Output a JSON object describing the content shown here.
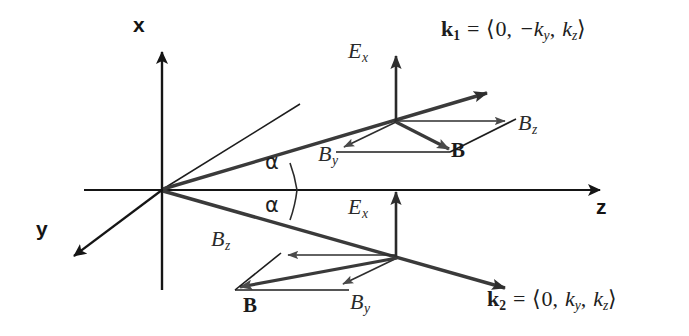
{
  "figure": {
    "background_color": "#ffffff",
    "ink_color": "#1d1d1d",
    "arrow_fill_color": "#4a4a4a",
    "width": 689,
    "height": 336
  },
  "axes": [
    {
      "name": "x",
      "label": "x",
      "direction": "up"
    },
    {
      "name": "y",
      "label": "y",
      "direction": "down-left"
    },
    {
      "name": "z",
      "label": "z",
      "direction": "right"
    }
  ],
  "angles": [
    {
      "name": "alpha-upper",
      "label": "α",
      "between": "k1 and z-axis"
    },
    {
      "name": "alpha-lower",
      "label": "α",
      "between": "k2 and z-axis"
    }
  ],
  "wave_vectors": [
    {
      "name": "k1",
      "symbol": "k",
      "subscript": "1",
      "equals": "=",
      "open_bracket": "⟨",
      "components": [
        "0",
        "−k",
        "k"
      ],
      "component_subscripts": [
        "",
        "y",
        "z"
      ],
      "close_bracket": "⟩",
      "full_text": "k₁ = ⟨0, −kᵧ, kᵩ⟩",
      "direction": "up-right"
    },
    {
      "name": "k2",
      "symbol": "k",
      "subscript": "2",
      "equals": "=",
      "open_bracket": "⟨",
      "components": [
        "0",
        "k",
        "k"
      ],
      "component_subscripts": [
        "",
        "y",
        "z"
      ],
      "close_bracket": "⟩",
      "full_text": "k₂ = ⟨0, kᵧ, kᵩ⟩",
      "direction": "down-right"
    }
  ],
  "field_labels": {
    "upper": {
      "E_symbol": "E",
      "E_subscript": "x",
      "By_symbol": "B",
      "By_subscript": "y",
      "Bz_symbol": "B",
      "Bz_subscript": "z",
      "B_resultant": "B"
    },
    "lower": {
      "E_symbol": "E",
      "E_subscript": "x",
      "By_symbol": "B",
      "By_subscript": "y",
      "Bz_symbol": "B",
      "Bz_subscript": "z",
      "B_resultant": "B"
    }
  }
}
